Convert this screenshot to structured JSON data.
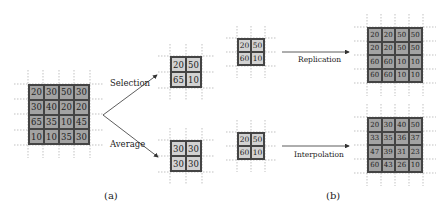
{
  "panel_a": {
    "caption": "(a)",
    "input_grid": [
      [
        "20",
        "30",
        "50",
        "30"
      ],
      [
        "30",
        "40",
        "20",
        "20"
      ],
      [
        "65",
        "35",
        "10",
        "45"
      ],
      [
        "10",
        "10",
        "35",
        "30"
      ]
    ],
    "selection": {
      "label": "Selection",
      "grid": [
        [
          "20",
          "50"
        ],
        [
          "65",
          "10"
        ]
      ]
    },
    "average": {
      "label": "Average",
      "grid": [
        [
          "30",
          "30"
        ],
        [
          "30",
          "30"
        ]
      ]
    }
  },
  "panel_b": {
    "caption": "(b)",
    "replication": {
      "label": "Replication",
      "input_grid": [
        [
          "20",
          "50"
        ],
        [
          "60",
          "10"
        ]
      ],
      "output_grid": [
        [
          "20",
          "20",
          "50",
          "50"
        ],
        [
          "20",
          "20",
          "50",
          "50"
        ],
        [
          "60",
          "60",
          "10",
          "10"
        ],
        [
          "60",
          "60",
          "10",
          "10"
        ]
      ]
    },
    "interpolation": {
      "label": "Interpolation",
      "input_grid": [
        [
          "20",
          "50"
        ],
        [
          "60",
          "10"
        ]
      ],
      "output_grid": [
        [
          "20",
          "30",
          "40",
          "50"
        ],
        [
          "33",
          "35",
          "36",
          "37"
        ],
        [
          "47",
          "39",
          "31",
          "23"
        ],
        [
          "60",
          "43",
          "26",
          "10"
        ]
      ]
    }
  },
  "colors": {
    "dark_cell": "#a3a3a3",
    "light_cell": "#d2d2d2",
    "line": "#444444",
    "guide": "#999999"
  }
}
